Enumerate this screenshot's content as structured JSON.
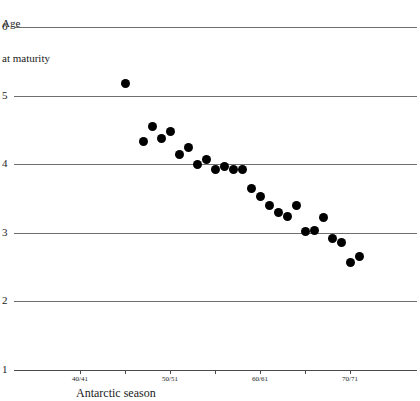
{
  "chart_data": {
    "type": "scatter",
    "title": "",
    "ylabel_lines": [
      "Age",
      "at maturity"
    ],
    "xlabel": "Antarctic season",
    "ylim": [
      1,
      6
    ],
    "y_ticks": [
      6,
      5,
      4,
      3,
      2,
      1
    ],
    "grid": true,
    "legend": null,
    "xlim": [
      1938,
      1973
    ],
    "x_tick_labels": [
      "40/41",
      "50/51",
      "60/61",
      "70/71"
    ],
    "x_tick_label_years": [
      1940,
      1950,
      1960,
      1970
    ],
    "x_minor_tick_years": [
      1945,
      1955,
      1965
    ],
    "points": [
      {
        "x": 1945,
        "y": 5.18
      },
      {
        "x": 1947,
        "y": 4.33
      },
      {
        "x": 1948,
        "y": 4.55
      },
      {
        "x": 1949,
        "y": 4.38
      },
      {
        "x": 1950,
        "y": 4.47
      },
      {
        "x": 1951,
        "y": 4.14
      },
      {
        "x": 1952,
        "y": 4.24
      },
      {
        "x": 1953,
        "y": 3.99
      },
      {
        "x": 1954,
        "y": 4.07
      },
      {
        "x": 1955,
        "y": 3.92
      },
      {
        "x": 1956,
        "y": 3.97
      },
      {
        "x": 1957,
        "y": 3.93
      },
      {
        "x": 1958,
        "y": 3.92
      },
      {
        "x": 1959,
        "y": 3.64
      },
      {
        "x": 1960,
        "y": 3.53
      },
      {
        "x": 1961,
        "y": 3.4
      },
      {
        "x": 1962,
        "y": 3.29
      },
      {
        "x": 1963,
        "y": 3.24
      },
      {
        "x": 1964,
        "y": 3.4
      },
      {
        "x": 1965,
        "y": 3.02
      },
      {
        "x": 1966,
        "y": 3.03
      },
      {
        "x": 1967,
        "y": 3.22
      },
      {
        "x": 1968,
        "y": 2.92
      },
      {
        "x": 1969,
        "y": 2.86
      },
      {
        "x": 1970,
        "y": 2.57
      },
      {
        "x": 1971,
        "y": 2.66
      }
    ]
  },
  "style": {
    "dot_color": "#000000",
    "grid_color": "#6e6e6e",
    "axis_color": "#4a4a4a",
    "background": "#ffffff"
  }
}
